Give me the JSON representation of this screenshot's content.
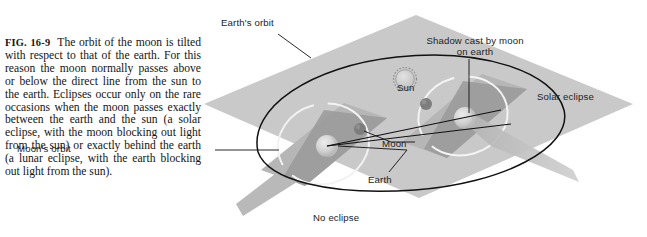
{
  "figure": {
    "id": "FIG. 16-9",
    "caption_body": "The orbit of the moon is tilted with respect to that of the earth. For this reason the moon normally passes above or below the direct line from the sun to the earth. Eclipses occur only on the rare occasions when the moon passes exactly between the earth and the sun (a solar eclipse, with the moon blocking out light from the sun) or exactly behind the earth (a lunar eclipse, with the earth blocking out light from the sun)."
  },
  "diagram": {
    "type": "astronomy-schematic",
    "title_implied": "Tilt of the moon's orbit relative to earth's orbit",
    "labels": {
      "earths_orbit": "Earth's orbit",
      "shadow_cast": "Shadow cast by moon on earth",
      "sun": "Sun",
      "solar_eclipse": "Solar eclipse",
      "moon": "Moon",
      "moons_orbit": "Moon's orbit",
      "earth": "Earth",
      "no_eclipse": "No eclipse"
    },
    "objects": {
      "sun_body": "sun-icon",
      "earth_left": "earth-sphere-no-eclipse",
      "earth_right": "earth-sphere-solar-eclipse",
      "moon_left": "moon-dot-above-plane",
      "moon_right": "moon-dot-in-line",
      "shadow_cone": "moon-shadow-cone",
      "ecliptic_plane": "earth-orbital-plane",
      "lunar_plane_left": "tilted-moon-orbital-plane-left",
      "lunar_plane_right": "tilted-moon-orbital-plane-right"
    },
    "colors": {
      "ecliptic_plane": "#c8c8c8",
      "lunar_plane": "#a8a8a8",
      "lunar_plane_dark": "#8f8f8f",
      "orbit_line": "#111111",
      "moon_dot": "#7a7a7a",
      "earth_body": "#d7d7d7",
      "shadow_cone": "#bdbdbd",
      "label_text": "#1d1d1d",
      "background": "#ffffff"
    }
  }
}
